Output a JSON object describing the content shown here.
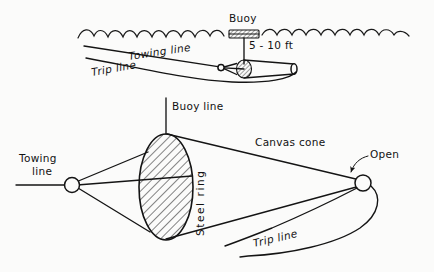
{
  "figure": {
    "background_color": "#fbfbfa",
    "ink_color": "#141414"
  },
  "top_view": {
    "name": "in-water deployment view",
    "labels": {
      "buoy": "Buoy",
      "depth": "5 - 10 ft",
      "towing_line": "Towing line",
      "trip_line": "Trip line"
    }
  },
  "bottom_view": {
    "name": "net assembly detail view",
    "labels": {
      "buoy_line": "Buoy line",
      "towing_line": "Towing\nline",
      "towing_line_1": "Towing",
      "towing_line_2": "line",
      "steel_ring": "Steel ring",
      "canvas_cone": "Canvas cone",
      "open": "Open",
      "trip_line": "Trip line"
    }
  }
}
